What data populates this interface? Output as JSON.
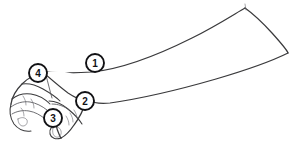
{
  "figure": {
    "type": "anatomical-line-drawing",
    "view": "lateral",
    "background_color": "#ffffff",
    "line_color": "#3a3a3c",
    "marker_fill_color": "#ffffff",
    "marker_stroke_color": "#111114",
    "width": 298,
    "height": 151
  },
  "markers": [
    {
      "id": "marker-1",
      "label": "①",
      "number": "1",
      "x": 95,
      "y": 63,
      "radius": 9
    },
    {
      "id": "marker-2",
      "label": "②",
      "number": "2",
      "x": 85,
      "y": 101,
      "radius": 9
    },
    {
      "id": "marker-3",
      "label": "③",
      "number": "3",
      "x": 53,
      "y": 118,
      "radius": 9
    },
    {
      "id": "marker-4",
      "label": "④",
      "number": "4",
      "x": 38,
      "y": 73,
      "radius": 9
    }
  ]
}
